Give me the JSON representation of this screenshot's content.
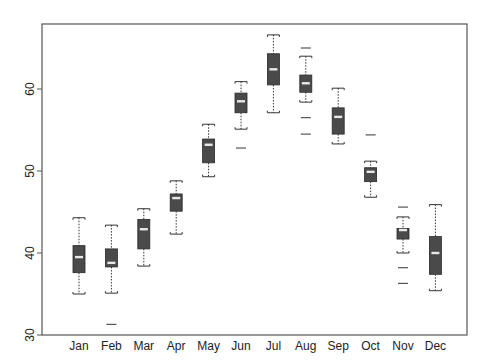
{
  "chart_data": {
    "type": "box",
    "title": "",
    "xlabel": "",
    "ylabel": "",
    "ylim": [
      30,
      67
    ],
    "yticks": [
      30,
      40,
      50,
      60
    ],
    "grid": false,
    "legend": null,
    "categories": [
      "Jan",
      "Feb",
      "Mar",
      "Apr",
      "May",
      "Jun",
      "Jul",
      "Aug",
      "Sep",
      "Oct",
      "Nov",
      "Dec"
    ],
    "boxes": [
      {
        "label": "Jan",
        "whisker_low": 35.0,
        "q1": 37.6,
        "median": 39.5,
        "q3": 40.9,
        "whisker_high": 44.3,
        "outliers": []
      },
      {
        "label": "Feb",
        "whisker_low": 35.1,
        "q1": 38.3,
        "median": 38.8,
        "q3": 40.5,
        "whisker_high": 43.4,
        "outliers": [
          31.3
        ]
      },
      {
        "label": "Mar",
        "whisker_low": 38.4,
        "q1": 40.5,
        "median": 42.9,
        "q3": 44.1,
        "whisker_high": 45.4,
        "outliers": []
      },
      {
        "label": "Apr",
        "whisker_low": 42.3,
        "q1": 45.1,
        "median": 46.7,
        "q3": 47.2,
        "whisker_high": 48.8,
        "outliers": []
      },
      {
        "label": "May",
        "whisker_low": 49.3,
        "q1": 51.0,
        "median": 53.2,
        "q3": 53.9,
        "whisker_high": 55.7,
        "outliers": []
      },
      {
        "label": "Jun",
        "whisker_low": 55.1,
        "q1": 57.1,
        "median": 58.5,
        "q3": 59.5,
        "whisker_high": 60.9,
        "outliers": [
          52.8
        ]
      },
      {
        "label": "Jul",
        "whisker_low": 57.1,
        "q1": 60.5,
        "median": 62.4,
        "q3": 64.3,
        "whisker_high": 66.6,
        "outliers": []
      },
      {
        "label": "Aug",
        "whisker_low": 58.4,
        "q1": 59.6,
        "median": 60.7,
        "q3": 61.7,
        "whisker_high": 64.0,
        "outliers": [
          65.0,
          56.5,
          54.5
        ]
      },
      {
        "label": "Sep",
        "whisker_low": 53.3,
        "q1": 54.5,
        "median": 56.6,
        "q3": 57.7,
        "whisker_high": 60.1,
        "outliers": []
      },
      {
        "label": "Oct",
        "whisker_low": 46.8,
        "q1": 48.7,
        "median": 49.9,
        "q3": 50.4,
        "whisker_high": 51.2,
        "outliers": [
          54.4
        ]
      },
      {
        "label": "Nov",
        "whisker_low": 40.0,
        "q1": 41.7,
        "median": 42.8,
        "q3": 43.0,
        "whisker_high": 44.4,
        "outliers": [
          45.6,
          38.2,
          36.3
        ]
      },
      {
        "label": "Dec",
        "whisker_low": 35.4,
        "q1": 37.4,
        "median": 40.0,
        "q3": 42.0,
        "whisker_high": 45.9,
        "outliers": []
      }
    ]
  },
  "style": {
    "box_fill": "#4a4a4a",
    "median_color": "#e8e8e8",
    "line_color": "#333333",
    "frame_color": "#555555"
  }
}
